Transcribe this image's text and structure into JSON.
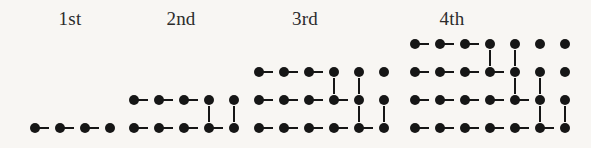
{
  "figure": {
    "title": "",
    "background_color": "#f8f6f3",
    "dot_color": "#161616",
    "label_color": "#2b2b2b"
  },
  "chart_data": {
    "type": "diagram",
    "title": "",
    "xlabel": "",
    "ylabel": "",
    "legend": [],
    "grid": false,
    "categories": [
      "1st",
      "2nd",
      "3rd",
      "4th"
    ],
    "values": [
      4,
      9,
      15,
      22
    ],
    "series": [
      {
        "name": "dot count",
        "values": [
          4,
          9,
          15,
          22
        ]
      },
      {
        "name": "rows",
        "values": [
          1,
          2,
          3,
          4
        ]
      },
      {
        "name": "columns",
        "values": [
          4,
          5,
          6,
          7
        ]
      }
    ]
  },
  "patterns": [
    {
      "label": "1st",
      "label_x": 70,
      "label_y": 9,
      "origin_x": 30,
      "origin_y": 128,
      "rows": 1,
      "cols": 4,
      "dot_count": 4,
      "row_lengths": [
        4
      ]
    },
    {
      "label": "2nd",
      "label_x": 181,
      "label_y": 9,
      "origin_x": 129,
      "origin_y": 128,
      "rows": 2,
      "cols": 5,
      "dot_count": 9,
      "row_lengths": [
        5,
        4
      ]
    },
    {
      "label": "3rd",
      "label_x": 305,
      "label_y": 9,
      "origin_x": 254,
      "origin_y": 128,
      "rows": 3,
      "cols": 6,
      "dot_count": 15,
      "row_lengths": [
        6,
        5,
        4
      ]
    },
    {
      "label": "4th",
      "label_x": 452,
      "label_y": 9,
      "origin_x": 410,
      "origin_y": 128,
      "rows": 4,
      "cols": 7,
      "dot_count": 22,
      "row_lengths": [
        7,
        6,
        5,
        4
      ]
    }
  ],
  "geometry": {
    "dx": 25,
    "dy": 28,
    "dot_size": 10,
    "h_line_thickness": 2,
    "v_line_thickness": 2
  }
}
